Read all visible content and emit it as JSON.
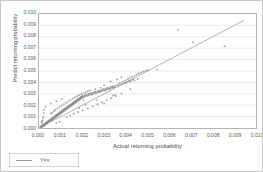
{
  "chart_data": {
    "type": "scatter",
    "title": "",
    "xlabel": "Actual returning probability",
    "ylabel": "Predict returning probability",
    "xlim": [
      0.0,
      0.01
    ],
    "ylim": [
      0.0,
      0.01
    ],
    "grid": "horizontal",
    "legend_position": "below-left",
    "xticks": [
      "0.000",
      "0.001",
      "0.002",
      "0.003",
      "0.004",
      "0.005",
      "0.006",
      "0.007",
      "0.008",
      "0.009",
      "0.010"
    ],
    "yticks": [
      "0.000",
      "0.001",
      "0.002",
      "0.003",
      "0.004",
      "0.005",
      "0.006",
      "0.007",
      "0.008",
      "0.009",
      "0.010"
    ],
    "xtick_values": [
      0.0,
      0.001,
      0.002,
      0.003,
      0.004,
      0.005,
      0.006,
      0.007,
      0.008,
      0.009,
      0.01
    ],
    "ytick_values": [
      0.0,
      0.001,
      0.002,
      0.003,
      0.004,
      0.005,
      0.006,
      0.007,
      0.008,
      0.009,
      0.01
    ],
    "colors": {
      "point": "#8c8c8c",
      "line": "#a0a0a0",
      "grid": "#e2e2e2",
      "frame": "#b5b5b5",
      "text": "#555555"
    },
    "series": [
      {
        "name": "points",
        "type": "scatter",
        "marker": "circle",
        "color": "#8c8c8c",
        "points": [
          [
            5e-05,
            8e-05
          ],
          [
            8e-05,
            0.00012
          ],
          [
            0.0001,
            6e-05
          ],
          [
            0.00012,
            0.00018
          ],
          [
            0.00013,
            0.0001
          ],
          [
            0.00015,
            0.00022
          ],
          [
            0.00016,
            0.00014
          ],
          [
            0.00018,
            0.00026
          ],
          [
            0.0002,
            0.00016
          ],
          [
            0.0002,
            0.0003
          ],
          [
            0.00022,
            0.00024
          ],
          [
            0.00024,
            0.00034
          ],
          [
            0.00025,
            0.0002
          ],
          [
            0.00026,
            0.00038
          ],
          [
            0.00028,
            0.00028
          ],
          [
            0.0003,
            0.00042
          ],
          [
            0.0003,
            0.00032
          ],
          [
            0.00032,
            0.00046
          ],
          [
            0.00034,
            0.00036
          ],
          [
            0.00035,
            0.0005
          ],
          [
            0.00036,
            0.0004
          ],
          [
            0.00038,
            0.00054
          ],
          [
            0.0004,
            0.00044
          ],
          [
            0.0004,
            0.00058
          ],
          [
            0.00042,
            0.00048
          ],
          [
            0.00044,
            0.00062
          ],
          [
            0.00045,
            0.00052
          ],
          [
            0.00046,
            0.00066
          ],
          [
            0.00048,
            0.00056
          ],
          [
            0.0005,
            0.0007
          ],
          [
            0.0005,
            0.0006
          ],
          [
            0.00052,
            0.00074
          ],
          [
            0.00054,
            0.00064
          ],
          [
            0.00055,
            0.00078
          ],
          [
            0.00056,
            0.00068
          ],
          [
            0.00058,
            0.00082
          ],
          [
            0.0006,
            0.00072
          ],
          [
            0.0006,
            0.00086
          ],
          [
            0.00062,
            0.00076
          ],
          [
            0.00064,
            0.0009
          ],
          [
            0.00065,
            0.0008
          ],
          [
            0.00066,
            0.00094
          ],
          [
            0.00068,
            0.00084
          ],
          [
            0.0007,
            0.00098
          ],
          [
            0.0007,
            0.00088
          ],
          [
            0.00072,
            0.00102
          ],
          [
            0.00074,
            0.00092
          ],
          [
            0.00075,
            0.00106
          ],
          [
            0.00076,
            0.00096
          ],
          [
            0.00078,
            0.0011
          ],
          [
            0.0008,
            0.001
          ],
          [
            0.0008,
            0.00114
          ],
          [
            0.00082,
            0.00104
          ],
          [
            0.00084,
            0.00118
          ],
          [
            0.00085,
            0.00108
          ],
          [
            0.00086,
            0.00122
          ],
          [
            0.00088,
            0.00112
          ],
          [
            0.0009,
            0.00126
          ],
          [
            0.0009,
            0.00116
          ],
          [
            0.00092,
            0.0013
          ],
          [
            0.00094,
            0.0012
          ],
          [
            0.00095,
            0.00134
          ],
          [
            0.00096,
            0.00124
          ],
          [
            0.00098,
            0.00138
          ],
          [
            0.001,
            0.00128
          ],
          [
            0.001,
            0.00142
          ],
          [
            0.00102,
            0.00132
          ],
          [
            0.00104,
            0.00146
          ],
          [
            0.00105,
            0.00136
          ],
          [
            0.00106,
            0.0015
          ],
          [
            0.00108,
            0.0014
          ],
          [
            0.0011,
            0.00154
          ],
          [
            0.0011,
            0.00144
          ],
          [
            0.00112,
            0.00158
          ],
          [
            0.00114,
            0.00148
          ],
          [
            0.00115,
            0.00162
          ],
          [
            0.00116,
            0.00152
          ],
          [
            0.00118,
            0.00166
          ],
          [
            0.0012,
            0.00156
          ],
          [
            0.0012,
            0.0017
          ],
          [
            0.00122,
            0.0016
          ],
          [
            0.00124,
            0.00174
          ],
          [
            0.00125,
            0.00164
          ],
          [
            0.00126,
            0.00178
          ],
          [
            0.00128,
            0.00168
          ],
          [
            0.0013,
            0.00182
          ],
          [
            0.0013,
            0.00172
          ],
          [
            0.00132,
            0.00186
          ],
          [
            0.00134,
            0.00176
          ],
          [
            0.00135,
            0.0019
          ],
          [
            0.00136,
            0.0018
          ],
          [
            0.00138,
            0.00194
          ],
          [
            0.0014,
            0.00184
          ],
          [
            0.0014,
            0.00198
          ],
          [
            0.00142,
            0.00188
          ],
          [
            0.00144,
            0.00202
          ],
          [
            0.00145,
            0.00192
          ],
          [
            0.00146,
            0.00206
          ],
          [
            0.00148,
            0.00196
          ],
          [
            0.0015,
            0.0021
          ],
          [
            0.0015,
            0.002
          ],
          [
            0.00152,
            0.00214
          ],
          [
            0.00154,
            0.00204
          ],
          [
            0.00155,
            0.00218
          ],
          [
            0.00156,
            0.00208
          ],
          [
            0.00158,
            0.00222
          ],
          [
            0.0016,
            0.00212
          ],
          [
            0.0016,
            0.00226
          ],
          [
            0.00162,
            0.00216
          ],
          [
            0.00164,
            0.0023
          ],
          [
            0.00165,
            0.0022
          ],
          [
            0.00166,
            0.00234
          ],
          [
            0.00168,
            0.00224
          ],
          [
            0.0017,
            0.00238
          ],
          [
            0.0017,
            0.00228
          ],
          [
            0.00172,
            0.00242
          ],
          [
            0.00174,
            0.00232
          ],
          [
            0.00175,
            0.00246
          ],
          [
            0.00176,
            0.00236
          ],
          [
            0.00178,
            0.0025
          ],
          [
            0.0018,
            0.0024
          ],
          [
            0.0018,
            0.00254
          ],
          [
            0.00182,
            0.00244
          ],
          [
            0.00184,
            0.00258
          ],
          [
            0.00185,
            0.00248
          ],
          [
            0.00186,
            0.00262
          ],
          [
            0.00188,
            0.00252
          ],
          [
            0.0019,
            0.00266
          ],
          [
            0.0019,
            0.00256
          ],
          [
            0.00192,
            0.0027
          ],
          [
            0.00194,
            0.0026
          ],
          [
            0.00195,
            0.00274
          ],
          [
            0.00196,
            0.00264
          ],
          [
            0.00198,
            0.00278
          ],
          [
            0.002,
            0.00268
          ],
          [
            0.002,
            0.00282
          ],
          [
            0.00205,
            0.00272
          ],
          [
            0.0021,
            0.00286
          ],
          [
            0.0021,
            0.00276
          ],
          [
            0.00215,
            0.0029
          ],
          [
            0.0022,
            0.0028
          ],
          [
            0.0022,
            0.00294
          ],
          [
            0.00225,
            0.00284
          ],
          [
            0.0023,
            0.00298
          ],
          [
            0.0023,
            0.00288
          ],
          [
            0.00235,
            0.00302
          ],
          [
            0.0024,
            0.00292
          ],
          [
            0.0024,
            0.00306
          ],
          [
            0.00245,
            0.00296
          ],
          [
            0.0025,
            0.0031
          ],
          [
            0.0025,
            0.003
          ],
          [
            0.00255,
            0.00314
          ],
          [
            0.0026,
            0.00304
          ],
          [
            0.0026,
            0.00318
          ],
          [
            0.00265,
            0.00308
          ],
          [
            0.0027,
            0.00322
          ],
          [
            0.0027,
            0.00312
          ],
          [
            0.00275,
            0.00326
          ],
          [
            0.0028,
            0.00316
          ],
          [
            0.0028,
            0.0033
          ],
          [
            0.00285,
            0.0032
          ],
          [
            0.0029,
            0.00334
          ],
          [
            0.0029,
            0.00324
          ],
          [
            0.00295,
            0.00338
          ],
          [
            0.003,
            0.00328
          ],
          [
            0.003,
            0.00342
          ],
          [
            0.00305,
            0.00332
          ],
          [
            0.0031,
            0.00346
          ],
          [
            0.0031,
            0.00336
          ],
          [
            0.00315,
            0.0035
          ],
          [
            0.0032,
            0.0034
          ],
          [
            0.0032,
            0.00354
          ],
          [
            0.00325,
            0.00344
          ],
          [
            0.0033,
            0.00358
          ],
          [
            0.0033,
            0.00348
          ],
          [
            0.00335,
            0.00362
          ],
          [
            0.0034,
            0.00352
          ],
          [
            0.0034,
            0.00366
          ],
          [
            0.00345,
            0.00356
          ],
          [
            0.0035,
            0.0037
          ],
          [
            0.0035,
            0.0036
          ],
          [
            0.0036,
            0.0038
          ],
          [
            0.00365,
            0.0037
          ],
          [
            0.0037,
            0.0039
          ],
          [
            0.00375,
            0.00378
          ],
          [
            0.0038,
            0.004
          ],
          [
            0.00385,
            0.00386
          ],
          [
            0.0039,
            0.0041
          ],
          [
            0.00395,
            0.00394
          ],
          [
            0.004,
            0.0042
          ],
          [
            0.00405,
            0.00402
          ],
          [
            0.0041,
            0.0043
          ],
          [
            0.00415,
            0.0041
          ],
          [
            0.0042,
            0.0044
          ],
          [
            0.00425,
            0.00418
          ],
          [
            0.0043,
            0.0045
          ],
          [
            0.00435,
            0.00426
          ],
          [
            0.0044,
            0.0046
          ],
          [
            0.0045,
            0.0047
          ],
          [
            0.0046,
            0.00478
          ],
          [
            0.0047,
            0.00486
          ],
          [
            0.0048,
            0.00494
          ],
          [
            0.0049,
            0.005
          ],
          [
            0.005,
            0.00508
          ],
          [
            0.00055,
            0.00125
          ],
          [
            0.0006,
            0.00135
          ],
          [
            0.00068,
            0.00148
          ],
          [
            0.00075,
            0.00158
          ],
          [
            0.00085,
            0.00172
          ],
          [
            0.00095,
            0.00185
          ],
          [
            0.00105,
            0.00198
          ],
          [
            0.00115,
            0.0021
          ],
          [
            0.00125,
            0.00222
          ],
          [
            0.00135,
            0.00234
          ],
          [
            0.00145,
            0.00246
          ],
          [
            0.00155,
            0.00258
          ],
          [
            0.00165,
            0.00268
          ],
          [
            0.00175,
            0.00278
          ],
          [
            0.00185,
            0.00288
          ],
          [
            0.00195,
            0.00298
          ],
          [
            0.00205,
            0.00306
          ],
          [
            0.00215,
            0.00314
          ],
          [
            0.00225,
            0.00322
          ],
          [
            0.00235,
            0.0033
          ],
          [
            0.0002,
            0.001
          ],
          [
            0.00022,
            0.0013
          ],
          [
            0.00024,
            0.0016
          ],
          [
            0.0003,
            0.00185
          ],
          [
            0.00016,
            0.00065
          ],
          [
            0.00018,
            0.00085
          ],
          [
            0.00012,
            0.00055
          ],
          [
            0.00014,
            0.00045
          ],
          [
            0.00055,
            0.00215
          ],
          [
            0.0008,
            0.00235
          ],
          [
            0.00105,
            0.00255
          ],
          [
            0.00185,
            0.00175
          ],
          [
            0.00215,
            0.00205
          ],
          [
            0.00265,
            0.00245
          ],
          [
            0.003,
            0.00215
          ],
          [
            0.0034,
            0.00285
          ],
          [
            0.0035,
            0.0029
          ],
          [
            0.0038,
            0.003
          ],
          [
            0.004,
            0.00395
          ],
          [
            0.0042,
            0.00405
          ],
          [
            0.0044,
            0.00415
          ],
          [
            0.00455,
            0.0043
          ],
          [
            0.0038,
            0.00445
          ],
          [
            0.0036,
            0.00425
          ],
          [
            0.0033,
            0.00408
          ],
          [
            0.003,
            0.00375
          ],
          [
            0.00285,
            0.00352
          ],
          [
            0.0026,
            0.0034
          ],
          [
            0.00128,
            0.00095
          ],
          [
            0.00145,
            0.0011
          ],
          [
            0.0016,
            0.00125
          ],
          [
            0.0018,
            0.0014
          ],
          [
            0.002,
            0.00155
          ],
          [
            0.00225,
            0.00172
          ],
          [
            0.00248,
            0.0019
          ],
          [
            0.0027,
            0.00208
          ],
          [
            0.0029,
            0.00226
          ],
          [
            0.00312,
            0.00244
          ],
          [
            0.00333,
            0.00262
          ],
          [
            0.00355,
            0.0028
          ],
          [
            0.0064,
            0.0086
          ],
          [
            0.0071,
            0.00752
          ],
          [
            0.00855,
            0.00718
          ],
          [
            0.00545,
            0.0051
          ],
          [
            0.0042,
            0.0034
          ],
          [
            0.00205,
            0.00245
          ],
          [
            0.0008,
            0.00045
          ],
          [
            0.00095,
            0.00055
          ]
        ]
      },
      {
        "name": "Y=x",
        "type": "line",
        "color": "#a0a0a0",
        "from": [
          0.00055,
          0.00055
        ],
        "to": [
          0.00945,
          0.00945
        ]
      }
    ]
  },
  "legend": {
    "label": "Y=x"
  }
}
